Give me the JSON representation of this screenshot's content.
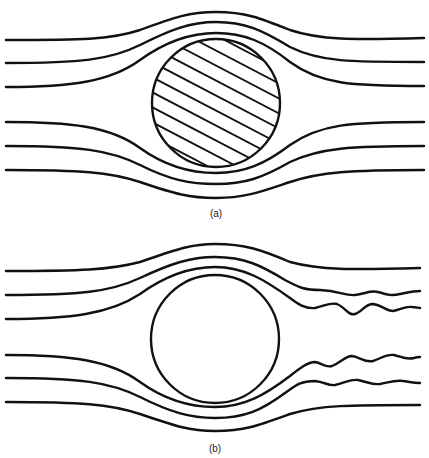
{
  "figure": {
    "panels": [
      {
        "id": "a",
        "caption": "(a)",
        "description": "Streamlines around a hatched solid circle (laminar flow, symmetric)",
        "body": {
          "shape": "circle",
          "cx": 216,
          "cy": 103,
          "r": 65,
          "hatched": true
        },
        "streamlines": 6,
        "wake": "none"
      },
      {
        "id": "b",
        "caption": "(b)",
        "description": "Streamlines around an open circle with wavy wake downstream",
        "body": {
          "shape": "circle",
          "cx": 215,
          "cy": 339,
          "r": 64,
          "hatched": false
        },
        "streamlines": 6,
        "wake": "wavy inner streamlines downstream"
      }
    ],
    "colors": {
      "line": "#111111",
      "background": "#ffffff"
    }
  }
}
